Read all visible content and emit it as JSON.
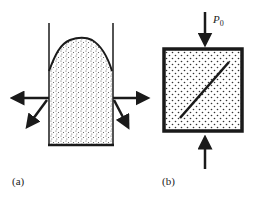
{
  "figure": {
    "panels": [
      {
        "id": "a",
        "label": "(a)",
        "description": "Granular material in a container with open top, bulging dome, lateral force arrows on both sides"
      },
      {
        "id": "b",
        "label": "(b)",
        "description": "Square granular specimen under vertical compressive load with a diagonal shear band",
        "load_label": "P",
        "load_subscript": "0"
      }
    ],
    "colors": {
      "stroke": "#1a1a1a",
      "fill": "#ffffff",
      "stipple": "#444444"
    }
  }
}
